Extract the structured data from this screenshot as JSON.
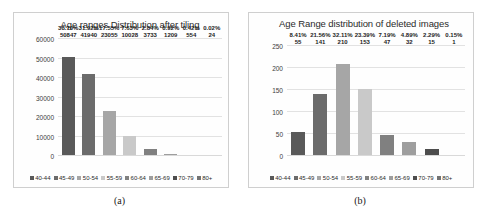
{
  "figure": {
    "panels": [
      {
        "caption": "(a)",
        "chart_title": "Age ranges Distribution after tiling"
      },
      {
        "caption": "(b)",
        "chart_title": "Age Range distribution of deleted images"
      }
    ]
  },
  "chart_data": [
    {
      "type": "bar",
      "title": "Age ranges Distribution after tiling",
      "xlabel": "",
      "ylabel": "",
      "ylim": [
        0,
        60000
      ],
      "yticks": [
        0,
        10000,
        20000,
        30000,
        40000,
        50000,
        60000
      ],
      "ytick_labels": [
        "0",
        "10000",
        "20000",
        "30000",
        "40000",
        "50000",
        "60000"
      ],
      "grid": true,
      "legend_position": "bottom",
      "categories": [
        "40-44",
        "45-49",
        "50-54",
        "55-59",
        "60-64",
        "65-69",
        "70-79",
        "80+"
      ],
      "values": [
        50847,
        41940,
        23055,
        10028,
        3733,
        1209,
        554,
        24
      ],
      "percent_labels": [
        "38.70%",
        "31.92%",
        "17.55%",
        "7.63%",
        "2.84%",
        "0.92%",
        "0.42%",
        "0.02%"
      ],
      "value_labels": [
        "50847",
        "41940",
        "23055",
        "10028",
        "3733",
        "1209",
        "554",
        "24"
      ],
      "colors": [
        "#595959",
        "#6b6b6b",
        "#a6a6a6",
        "#c9c9c9",
        "#808080",
        "#9e9e9e",
        "#4d4d4d",
        "#737373"
      ]
    },
    {
      "type": "bar",
      "title": "Age Range distribution of deleted images",
      "xlabel": "",
      "ylabel": "",
      "ylim": [
        0,
        250
      ],
      "yticks": [
        0,
        50,
        100,
        150,
        200,
        250
      ],
      "ytick_labels": [
        "0",
        "50",
        "100",
        "150",
        "200",
        "250"
      ],
      "grid": true,
      "legend_position": "bottom",
      "categories": [
        "40-44",
        "45-49",
        "50-54",
        "55-59",
        "60-64",
        "65-69",
        "70-79",
        "80+"
      ],
      "values": [
        55,
        141,
        210,
        153,
        47,
        32,
        15,
        1
      ],
      "percent_labels": [
        "8.41%",
        "21.56%",
        "32.11%",
        "23.39%",
        "7.19%",
        "4.89%",
        "2.29%",
        "0.15%"
      ],
      "value_labels": [
        "55",
        "141",
        "210",
        "153",
        "47",
        "32",
        "15",
        "1"
      ],
      "colors": [
        "#595959",
        "#6b6b6b",
        "#a6a6a6",
        "#c9c9c9",
        "#808080",
        "#9e9e9e",
        "#4d4d4d",
        "#737373"
      ]
    }
  ],
  "legend": {
    "items": [
      {
        "label": "40-44",
        "color": "#595959"
      },
      {
        "label": "45-49",
        "color": "#6b6b6b"
      },
      {
        "label": "50-54",
        "color": "#a6a6a6"
      },
      {
        "label": "55-59",
        "color": "#c9c9c9"
      },
      {
        "label": "60-64",
        "color": "#808080"
      },
      {
        "label": "65-69",
        "color": "#9e9e9e"
      },
      {
        "label": "70-79",
        "color": "#4d4d4d"
      },
      {
        "label": "80+",
        "color": "#737373"
      }
    ]
  }
}
